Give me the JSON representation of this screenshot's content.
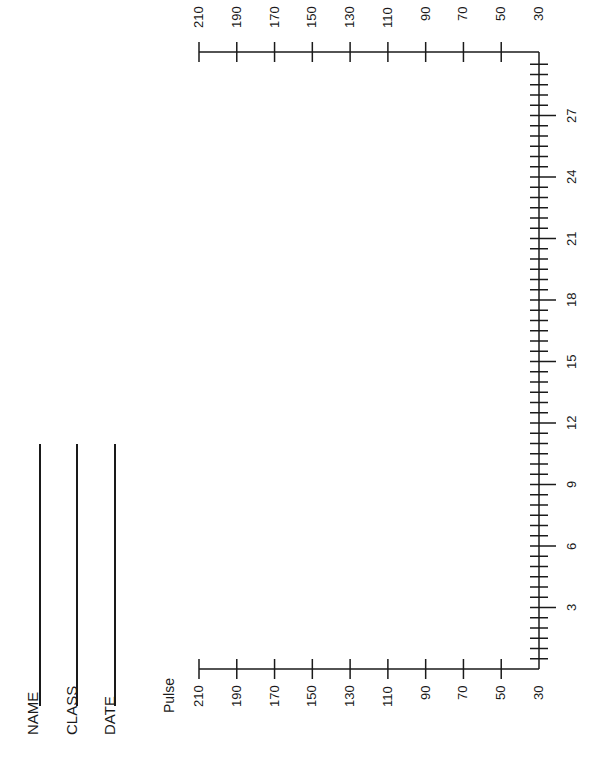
{
  "form": {
    "fields": [
      {
        "label": "NAME"
      },
      {
        "label": "CLASS"
      },
      {
        "label": "DATE"
      }
    ]
  },
  "chart_data": {
    "type": "line",
    "title": "",
    "orientation": "rotated 90° counter-clockwise (page printed sideways)",
    "xlabel": "",
    "ylabel": "Pulse",
    "x_ticks": [
      3,
      6,
      9,
      12,
      15,
      18,
      21,
      24,
      27
    ],
    "x_minor_step": 0.5,
    "xlim": [
      0,
      30
    ],
    "y_ticks": [
      210,
      190,
      170,
      150,
      130,
      110,
      90,
      70,
      50,
      30
    ],
    "ylim": [
      30,
      210
    ],
    "series": [],
    "grid": false,
    "legend": null,
    "note": "Blank worksheet graph – no data plotted; Pulse axis shown on both sides"
  }
}
